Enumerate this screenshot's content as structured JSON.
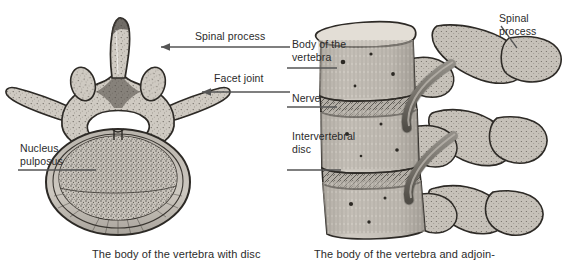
{
  "figure": {
    "background_color": "#ffffff",
    "text_color": "#2b2b2b",
    "line_color": "#555555"
  },
  "left_panel": {
    "caption": "The body of the vertebra with disc",
    "labels": {
      "spinal_process": "Spinal process",
      "facet_joint": "Facet joint",
      "nucleus_pulposus": "Nucleus\npulposus"
    }
  },
  "right_panel": {
    "caption": "The body of the vertebra and adjoin-",
    "labels": {
      "body_of_the_vertebra": "Body of the\nvertebra",
      "nerve": "Nerve",
      "intervertebral_disc": "Intervertebral\ndisc",
      "spinal_process": "Spinal\nprocess"
    }
  }
}
